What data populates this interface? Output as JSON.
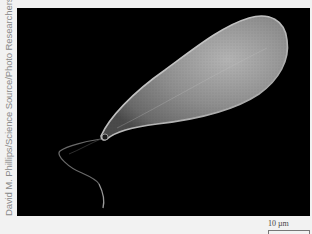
{
  "figure": {
    "credit": "David M. Phillips/Science Source/Photo Researchers Inc.",
    "scale_bar": {
      "label": "10 µm"
    },
    "colors": {
      "background": "#000000",
      "frame": "#f2f2f2",
      "cell": "#9a9a9a"
    }
  }
}
